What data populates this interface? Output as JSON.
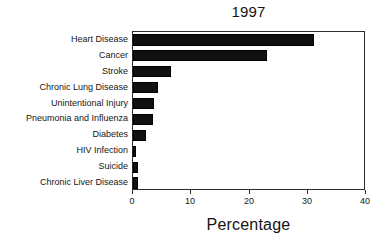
{
  "chart_data": {
    "type": "bar",
    "orientation": "horizontal",
    "title": "1997",
    "xlabel": "Percentage",
    "ylabel": "",
    "xlim": [
      0,
      40
    ],
    "xticks": [
      0,
      10,
      20,
      30,
      40
    ],
    "xtick_labels": [
      "0",
      "10",
      "20",
      "30",
      "40"
    ],
    "grid": false,
    "legend": false,
    "bar_color": "#111111",
    "categories": [
      "Heart Disease",
      "Cancer",
      "Stroke",
      "Chronic Lung Disease",
      "Unintentional Injury",
      "Pneumonia  and Influenza",
      "Diabetes",
      "HIV Infection",
      "Suicide",
      "Chronic Liver Disease"
    ],
    "values": [
      31.1,
      23.0,
      6.5,
      4.3,
      3.6,
      3.4,
      2.3,
      0.4,
      0.9,
      0.8
    ]
  }
}
